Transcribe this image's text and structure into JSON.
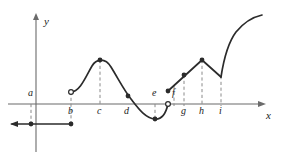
{
  "figure": {
    "type": "function-graph",
    "axes": {
      "x_label": "x",
      "y_label": "y",
      "x_axis_y_px": 104,
      "y_axis_x_px": 36,
      "x_axis_start_px": 8,
      "x_axis_end_px": 262,
      "y_axis_top_px": 14,
      "y_axis_bottom_px": 152
    },
    "tick_labels": [
      {
        "id": "a",
        "text": "a",
        "x_px": 31,
        "side": "above"
      },
      {
        "id": "b",
        "text": "b",
        "x_px": 71,
        "side": "below"
      },
      {
        "id": "c",
        "text": "c",
        "x_px": 100,
        "side": "below"
      },
      {
        "id": "d",
        "text": "d",
        "x_px": 127,
        "side": "below"
      },
      {
        "id": "e",
        "text": "e",
        "x_px": 155,
        "side": "above"
      },
      {
        "id": "f",
        "text": "f",
        "x_px": 174,
        "side": "above"
      },
      {
        "id": "g",
        "text": "g",
        "x_px": 184,
        "side": "below"
      },
      {
        "id": "h",
        "text": "h",
        "x_px": 202,
        "side": "below"
      },
      {
        "id": "i",
        "text": "i",
        "x_px": 221,
        "side": "below"
      }
    ],
    "dashed_guides": [
      {
        "id": "guide-a",
        "x_px": 31,
        "y_from_px": 104,
        "y_to_px": 124
      },
      {
        "id": "guide-b",
        "x_px": 71,
        "y_from_px": 92,
        "y_to_px": 124
      },
      {
        "id": "guide-c",
        "x_px": 100,
        "y_from_px": 60,
        "y_to_px": 104
      },
      {
        "id": "guide-e",
        "x_px": 155,
        "y_from_px": 104,
        "y_to_px": 119
      },
      {
        "id": "guide-f",
        "x_px": 174,
        "y_from_px": 86,
        "y_to_px": 104
      },
      {
        "id": "guide-g",
        "x_px": 184,
        "y_from_px": 75,
        "y_to_px": 104
      },
      {
        "id": "guide-h",
        "x_px": 202,
        "y_from_px": 60,
        "y_to_px": 104
      },
      {
        "id": "guide-i",
        "x_px": 221,
        "y_from_px": 76,
        "y_to_px": 104
      }
    ],
    "segments": [
      {
        "id": "constant-branch",
        "kind": "line",
        "path": "M 12,124 L 71,124",
        "note": "horizontal segment below axis from left edge to b"
      },
      {
        "id": "hump-branch",
        "kind": "curve",
        "path": "M 71,92 C 80,92 86,76 92,66 C 96,59 105,57 111,67 C 119,80 124,90 131,99 C 138,108 145,118 155,119 C 162,119.6 166,113 168,104",
        "note": "rises from b to maximum at c, falls through d to minimum at e, returns to axis"
      },
      {
        "id": "rising-line-1",
        "kind": "line",
        "path": "M 168,91 L 202,60",
        "note": "straight segment from just right of e up through f and g to peak at h"
      },
      {
        "id": "falling-line",
        "kind": "line",
        "path": "M 202,60 L 221,77",
        "note": "straight segment down from h to corner at i"
      },
      {
        "id": "final-curve",
        "kind": "curve",
        "path": "M 221,77 C 223,64 227,44 236,32 C 245,21 253,17 262,15",
        "note": "steeply rising concave-down curve from i to right edge"
      }
    ],
    "filled_points": [
      {
        "id": "pt-a",
        "x_px": 31,
        "y_px": 124
      },
      {
        "id": "pt-b-lower",
        "x_px": 71,
        "y_px": 124
      },
      {
        "id": "pt-c",
        "x_px": 100,
        "y_px": 60
      },
      {
        "id": "pt-d",
        "x_px": 128,
        "y_px": 96
      },
      {
        "id": "pt-e",
        "x_px": 155,
        "y_px": 119
      },
      {
        "id": "pt-f-start",
        "x_px": 168,
        "y_px": 91
      },
      {
        "id": "pt-g",
        "x_px": 184,
        "y_px": 75
      },
      {
        "id": "pt-h",
        "x_px": 202,
        "y_px": 60
      }
    ],
    "open_points": [
      {
        "id": "pt-b-upper",
        "x_px": 71,
        "y_px": 92
      },
      {
        "id": "pt-e-right",
        "x_px": 168,
        "y_px": 104
      }
    ],
    "colors": {
      "curve": "#2b2b2b",
      "axis": "#6b6b6b",
      "dash": "#8a8a8a",
      "label": "#1a1a1a",
      "background": "#ffffff"
    }
  }
}
